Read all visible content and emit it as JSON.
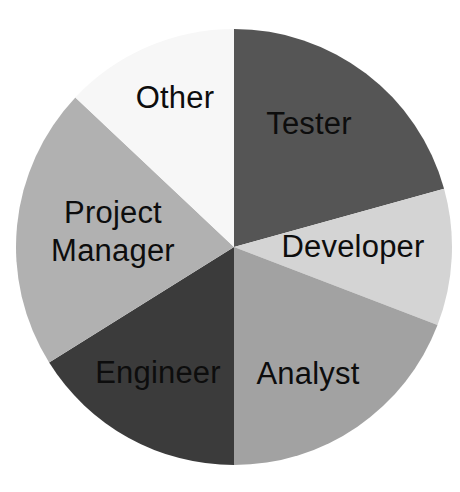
{
  "chart_data": {
    "type": "pie",
    "title": "",
    "subtitle": "",
    "xlabel": "",
    "ylabel": "",
    "legend_position": "none",
    "grid": false,
    "labels_inside_slices": true,
    "start_angle_deg": 0,
    "direction": "clockwise",
    "categories": [
      "Tester",
      "Developer",
      "Analyst",
      "Engineer",
      "Project Manager",
      "Other"
    ],
    "values": [
      20.7,
      10.1,
      19.2,
      16.1,
      20.8,
      13.1
    ],
    "units": "percent",
    "slices": [
      {
        "label": "Tester",
        "label_lines": [
          "Tester"
        ],
        "value": 20.7,
        "start_angle_deg": 0.0,
        "end_angle_deg": 74.5,
        "sweep_deg": 74.5,
        "color": "#555555",
        "label_color": "#0d0d0d",
        "label_x": 309,
        "label_y": 126
      },
      {
        "label": "Developer",
        "label_lines": [
          "Developer"
        ],
        "value": 10.1,
        "start_angle_deg": 74.5,
        "end_angle_deg": 111.0,
        "sweep_deg": 36.5,
        "color": "#d4d4d4",
        "label_color": "#0d0d0d",
        "label_x": 353,
        "label_y": 249
      },
      {
        "label": "Analyst",
        "label_lines": [
          "Analyst"
        ],
        "value": 19.2,
        "start_angle_deg": 111.0,
        "end_angle_deg": 180.0,
        "sweep_deg": 69.0,
        "color": "#a2a2a2",
        "label_color": "#0d0d0d",
        "label_x": 308,
        "label_y": 376
      },
      {
        "label": "Engineer",
        "label_lines": [
          "Engineer"
        ],
        "value": 16.1,
        "start_angle_deg": 180.0,
        "end_angle_deg": 238.0,
        "sweep_deg": 58.0,
        "color": "#3b3b3b",
        "label_color": "#0d0d0d",
        "label_x": 158,
        "label_y": 375
      },
      {
        "label": "Project Manager",
        "label_lines": [
          "Project",
          "Manager"
        ],
        "value": 20.8,
        "start_angle_deg": 238.0,
        "end_angle_deg": 313.3,
        "sweep_deg": 75.3,
        "color": "#b1b1b1",
        "label_color": "#0d0d0d",
        "label_x": 113,
        "label_y": 234
      },
      {
        "label": "Other",
        "label_lines": [
          "Other"
        ],
        "value": 13.1,
        "start_angle_deg": 313.3,
        "end_angle_deg": 360.0,
        "sweep_deg": 46.7,
        "color": "#f7f7f7",
        "label_color": "#0d0d0d",
        "label_x": 175,
        "label_y": 100
      }
    ],
    "geometry": {
      "center_x": 234,
      "center_y": 247,
      "radius": 218
    },
    "background_color": "#ffffff"
  }
}
